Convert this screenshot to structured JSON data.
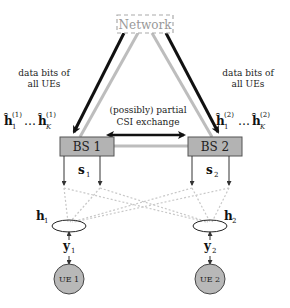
{
  "network": {
    "label": "Network"
  },
  "left_link": {
    "label_line1": "data bits of",
    "label_line2": "all UEs"
  },
  "right_link": {
    "label_line1": "data bits of",
    "label_line2": "all UEs"
  },
  "csi_exchange": {
    "label_line1": "(possibly) partial",
    "label_line2": "CSI exchange"
  },
  "bs1": {
    "label": "BS 1",
    "signal": "s",
    "signal_sub": "1",
    "csi": {
      "h": "ĥ",
      "first_sub": "1",
      "sup": "(1)",
      "dots": "…",
      "last_sub": "K"
    }
  },
  "bs2": {
    "label": "BS 2",
    "signal": "s",
    "signal_sub": "2",
    "csi": {
      "h": "ĥ",
      "first_sub": "1",
      "sup": "(2)",
      "dots": "…",
      "last_sub": "K"
    }
  },
  "ue1": {
    "label": "UE 1",
    "channel": "h",
    "channel_sub": "1",
    "rx": "y",
    "rx_sub": "1"
  },
  "ue2": {
    "label": "UE 2",
    "channel": "h",
    "channel_sub": "2",
    "rx": "y",
    "rx_sub": "2"
  },
  "colors": {
    "box_fill": "#b3b3b3",
    "ue_fill": "#b8b8b8",
    "gray_link": "#bdbdbd",
    "dotted": "#c8c8c8",
    "black": "#111111"
  }
}
